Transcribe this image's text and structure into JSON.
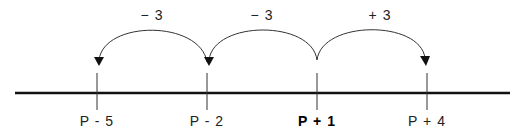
{
  "diagram": {
    "type": "number-line",
    "points": [
      {
        "label": "P - 5",
        "x": 97,
        "bold": false
      },
      {
        "label": "P - 2",
        "x": 207,
        "bold": false
      },
      {
        "label": "P + 1",
        "x": 317,
        "bold": true
      },
      {
        "label": "P + 4",
        "x": 427,
        "bold": false
      }
    ],
    "jumps": [
      {
        "label": "− 3",
        "from": "P - 2",
        "to": "P - 5",
        "x": 152
      },
      {
        "label": "− 3",
        "from": "P + 1",
        "to": "P - 2",
        "x": 262
      },
      {
        "label": "+ 3",
        "from": "P + 1",
        "to": "P + 4",
        "x": 380
      }
    ],
    "colors": {
      "line": "#111111",
      "arc": "#333333",
      "text": "#222222"
    }
  }
}
